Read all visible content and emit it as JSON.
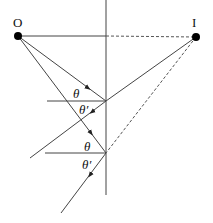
{
  "diagram": {
    "labels": {
      "source": "O",
      "image": "I",
      "theta": "θ",
      "theta_prime": "θ′"
    },
    "points": {
      "O": [
        18,
        36
      ],
      "I": [
        196,
        37
      ],
      "mirror_top": [
        106,
        0
      ],
      "mirror_bottom": [
        106,
        195
      ],
      "reflection_1": [
        106,
        101
      ],
      "reflection_2": [
        106,
        153
      ]
    },
    "colors": {
      "line": "#333333",
      "dot": "#000000",
      "dashed": "#555555"
    }
  }
}
